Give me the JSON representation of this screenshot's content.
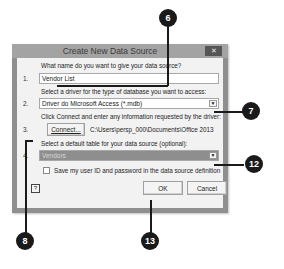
{
  "dialog": {
    "title": "Create New Data Source",
    "close_icon": "close-icon",
    "steps": [
      {
        "number": "1.",
        "prompt": "What name do you want to give your data source?",
        "value": "Vendor List"
      },
      {
        "number": "2.",
        "prompt": "Select a driver for the type of database you want to access:",
        "value": "Driver do Microsoft Access (*.mdb)"
      },
      {
        "number": "3.",
        "prompt": "Click Connect and enter any information requested by the driver:",
        "button_label": "Connect...",
        "path": "C:\\Users\\persp_000\\Documents\\Office 2013"
      },
      {
        "number": "4.",
        "prompt": "Select a default table for your data source (optional):",
        "value": "Vendors"
      }
    ],
    "save_checkbox_label": "Save my user ID and password in the data source definition",
    "save_checkbox_checked": false,
    "help_label": "?",
    "ok_label": "OK",
    "cancel_label": "Cancel",
    "colors": {
      "titlebar": "#a3a3a3",
      "content": "#f2f2f2",
      "selected_combo": "#8e8e8e",
      "callout": "#1a1a1a"
    }
  },
  "callouts": [
    {
      "label": "6"
    },
    {
      "label": "7"
    },
    {
      "label": "12"
    },
    {
      "label": "8"
    },
    {
      "label": "13"
    }
  ]
}
